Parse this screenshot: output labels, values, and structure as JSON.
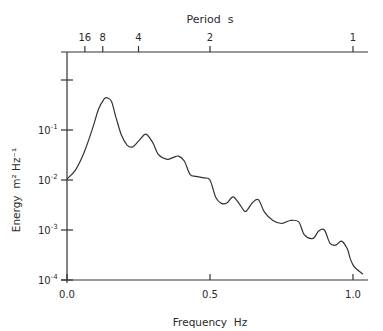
{
  "chart_data": {
    "type": "line",
    "title": "",
    "xlabel": "Frequency  Hz",
    "ylabel": "Energy  m² Hz⁻¹",
    "top_axis_label": "Period  s",
    "xlim": [
      0.0,
      1.04
    ],
    "ylim_log10": [
      -4,
      0.55
    ],
    "yscale": "log",
    "grid": false,
    "legend": null,
    "x_ticks": [
      {
        "value": 0.0,
        "label": "0.0"
      },
      {
        "value": 0.5,
        "label": "0.5"
      },
      {
        "value": 1.0,
        "label": "1.0"
      }
    ],
    "y_ticks": [
      {
        "value": 0.0001,
        "base": "10",
        "exp": "-4"
      },
      {
        "value": 0.001,
        "base": "10",
        "exp": "-3"
      },
      {
        "value": 0.01,
        "base": "10",
        "exp": "-2"
      },
      {
        "value": 0.1,
        "base": "10",
        "exp": "-1"
      },
      {
        "value": 1,
        "base": "",
        "exp": ""
      }
    ],
    "top_ticks": [
      {
        "period": 16,
        "label": "16"
      },
      {
        "period": 8,
        "label": "8"
      },
      {
        "period": 4,
        "label": "4"
      },
      {
        "period": 2,
        "label": "2"
      },
      {
        "period": 1,
        "label": "1"
      }
    ],
    "series": [
      {
        "name": "Energy spectrum",
        "x": [
          0.0,
          0.03,
          0.06,
          0.09,
          0.11,
          0.13,
          0.14,
          0.155,
          0.17,
          0.19,
          0.21,
          0.23,
          0.25,
          0.27,
          0.28,
          0.3,
          0.32,
          0.35,
          0.37,
          0.39,
          0.41,
          0.43,
          0.45,
          0.48,
          0.5,
          0.52,
          0.54,
          0.56,
          0.58,
          0.6,
          0.62,
          0.63,
          0.65,
          0.67,
          0.69,
          0.72,
          0.75,
          0.78,
          0.81,
          0.83,
          0.86,
          0.88,
          0.9,
          0.92,
          0.94,
          0.96,
          0.98,
          0.99,
          1.0,
          1.01,
          1.035
        ],
        "y": [
          0.0105,
          0.016,
          0.036,
          0.11,
          0.26,
          0.42,
          0.44,
          0.38,
          0.19,
          0.08,
          0.05,
          0.046,
          0.06,
          0.08,
          0.08,
          0.056,
          0.032,
          0.026,
          0.028,
          0.03,
          0.024,
          0.013,
          0.0118,
          0.011,
          0.01,
          0.0045,
          0.0034,
          0.0035,
          0.0046,
          0.0035,
          0.0024,
          0.0025,
          0.0036,
          0.004,
          0.0023,
          0.00155,
          0.00135,
          0.00155,
          0.00145,
          0.0008,
          0.00068,
          0.00095,
          0.001,
          0.00054,
          0.0005,
          0.0006,
          0.00042,
          0.00027,
          0.0002,
          0.00017,
          0.00013
        ]
      }
    ]
  }
}
